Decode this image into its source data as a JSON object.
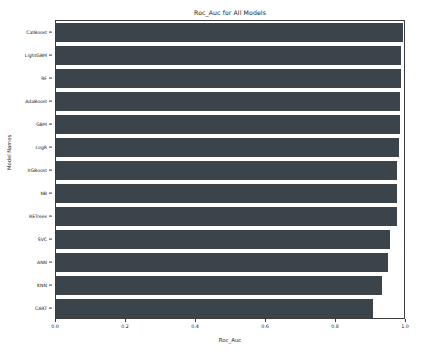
{
  "chart_data": {
    "type": "bar",
    "orientation": "horizontal",
    "title": "Roc_Auc for All Models",
    "xlabel": "Roc_Auc",
    "ylabel": "Model Names",
    "xlim": [
      0.0,
      1.0
    ],
    "xticks": [
      "0.0",
      "0.2",
      "0.4",
      "0.6",
      "0.8",
      "1.0"
    ],
    "xtick_values": [
      0.0,
      0.2,
      0.4,
      0.6,
      0.8,
      1.0
    ],
    "grid": false,
    "legend": "none",
    "bar_color": "#3b444b",
    "categories": [
      "CatBoost",
      "LightGBM",
      "RF",
      "AdaBoost",
      "GBM",
      "LogR",
      "XGBoost",
      "NB",
      "RETrees",
      "SVC",
      "ANN",
      "KNN",
      "CART"
    ],
    "values": [
      0.992,
      0.986,
      0.985,
      0.983,
      0.982,
      0.981,
      0.975,
      0.974,
      0.973,
      0.955,
      0.949,
      0.932,
      0.905
    ]
  }
}
